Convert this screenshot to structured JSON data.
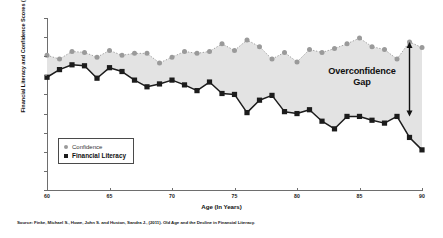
{
  "chart_data": {
    "type": "line",
    "title": "",
    "xlabel": "Age (In Years)",
    "ylabel": "Financial Literacy and Confidence Scores (%)",
    "xlim": [
      60,
      90
    ],
    "ylim": [
      0,
      90
    ],
    "xticks": [
      60,
      65,
      70,
      75,
      80,
      85,
      90
    ],
    "yticks": [
      0,
      10,
      20,
      30,
      40,
      50,
      60,
      70,
      80,
      90
    ],
    "grid": false,
    "legend_position": "lower-left",
    "x": [
      60,
      61,
      62,
      63,
      64,
      65,
      66,
      67,
      68,
      69,
      70,
      71,
      72,
      73,
      74,
      75,
      76,
      77,
      78,
      79,
      80,
      81,
      82,
      83,
      84,
      85,
      86,
      87,
      88,
      89,
      90
    ],
    "series": [
      {
        "name": "Confidence",
        "marker": "circle",
        "color": "#9a9a9a",
        "linestyle": "dotted",
        "values": [
          70.5,
          68.5,
          72.5,
          72.0,
          69.5,
          73.0,
          70.5,
          71.5,
          71.5,
          66.5,
          69.5,
          72.5,
          71.5,
          72.5,
          76.5,
          73.0,
          78.5,
          75.0,
          68.5,
          72.0,
          67.0,
          73.5,
          72.0,
          74.0,
          76.5,
          79.5,
          75.0,
          73.5,
          68.5,
          77.5,
          74.5
        ]
      },
      {
        "name": "Financial Literacy",
        "marker": "square",
        "color": "#1c1c1c",
        "linestyle": "solid",
        "values": [
          59.0,
          63.0,
          65.5,
          65.0,
          58.5,
          64.0,
          62.0,
          57.5,
          54.0,
          55.5,
          57.5,
          55.0,
          52.0,
          56.5,
          50.5,
          50.0,
          40.5,
          47.0,
          49.5,
          41.0,
          40.0,
          42.0,
          36.0,
          32.0,
          38.5,
          38.5,
          36.5,
          35.0,
          38.5,
          27.5,
          21.0
        ]
      }
    ],
    "annotations": [
      {
        "name": "overconfidence-gap",
        "text_line1": "Overconfidence",
        "text_line2": "Gap",
        "arrow": "double-headed-vertical",
        "arrow_x": 89,
        "arrow_y_top": 77.5,
        "arrow_y_bottom": 38.5
      }
    ],
    "area_fill": {
      "between": [
        "Financial Literacy",
        "Confidence"
      ],
      "color": "#e3e3e3"
    }
  },
  "legend": {
    "items": [
      {
        "label": "Confidence",
        "marker": "circle"
      },
      {
        "label": "Financial Literacy",
        "marker": "square"
      }
    ]
  },
  "source": {
    "text": "Source: Finke, Michael S., Howe, John S. and Huston, Sandra J., (2011). Old Age and the Decline in Financial Literacy."
  }
}
